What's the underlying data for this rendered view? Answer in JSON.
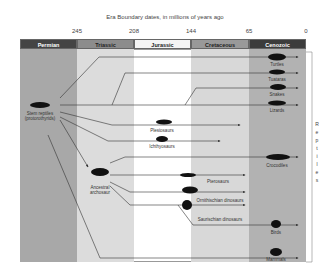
{
  "title": "Era Boundary dates, in millions of years ago",
  "ticks": [
    "245",
    "208",
    "144",
    "65",
    "0"
  ],
  "eras": [
    {
      "name": "Permian",
      "color": "#a8a8a8",
      "header": "#444444"
    },
    {
      "name": "Triassic",
      "color": "#dcdcdc",
      "header": "#8c8c8c"
    },
    {
      "name": "Jurassic",
      "color": "#ffffff",
      "header": "#f4f4f4"
    },
    {
      "name": "Cretaceous",
      "color": "#d8d8d8",
      "header": "#999999"
    },
    {
      "name": "Cenozoic",
      "color": "#b2b2b2",
      "header": "#3c3c3c"
    }
  ],
  "nodes": {
    "stem": "Stem reptiles (protorothyrids)",
    "stem_l1": "Stem reptiles",
    "stem_l2": "(protorothyrids)",
    "archosaur_l1": "Ancestral",
    "archosaur_l2": "archosaur"
  },
  "lineages": [
    "Turtles",
    "Tuataras",
    "Snakes",
    "Lizards",
    "Plesiosaurs",
    "Ichthyosaurs",
    "Crocodiles",
    "Pterosaurs",
    "Ornithischian dinosaurs",
    "Saurischian dinosaurs",
    "Birds",
    "Mammals"
  ],
  "group_label": "Reptiles"
}
